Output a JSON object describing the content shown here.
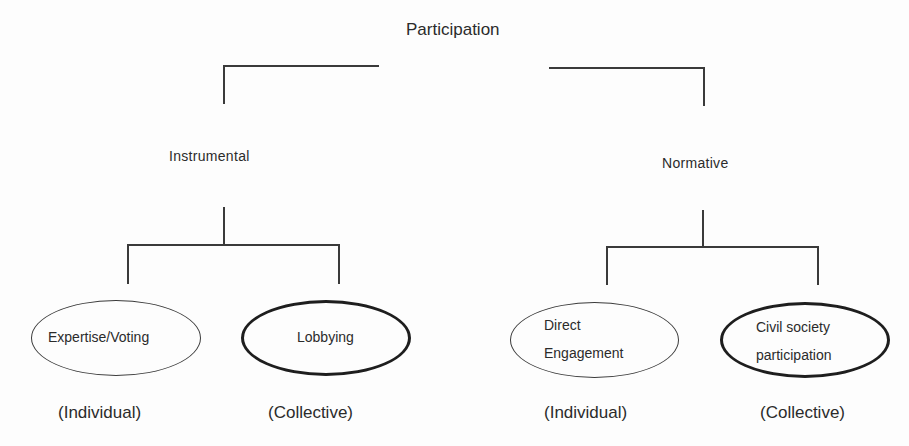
{
  "diagram": {
    "root": {
      "label": "Participation"
    },
    "branches": [
      {
        "label": "Instrumental",
        "children": [
          {
            "label": "Expertise/Voting",
            "lines": [
              "Expertise/Voting"
            ],
            "type": "(Individual)",
            "border": "thin"
          },
          {
            "label": "Lobbying",
            "lines": [
              "Lobbying"
            ],
            "type": "(Collective)",
            "border": "thick"
          }
        ]
      },
      {
        "label": "Normative",
        "children": [
          {
            "label": "Direct Engagement",
            "lines": [
              "Direct",
              "Engagement"
            ],
            "type": "(Individual)",
            "border": "thin"
          },
          {
            "label": "Civil society participation",
            "lines": [
              "Civil society",
              "participation"
            ],
            "type": "(Collective)",
            "border": "thick"
          }
        ]
      }
    ]
  },
  "colors": {
    "line": "#3a3a3a",
    "text": "#2b2b2b",
    "background": "#fdfdfd"
  }
}
